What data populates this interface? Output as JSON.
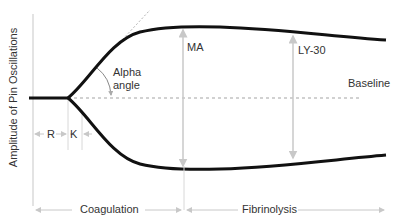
{
  "diagram": {
    "type": "thromboelastogram",
    "y_axis_label": "Amplitude of Pin Oscillations",
    "labels": {
      "alpha_line1": "Alpha",
      "alpha_line2": "angle",
      "ma": "MA",
      "ly30": "LY-30",
      "baseline": "Baseline",
      "r": "R",
      "k": "K",
      "coagulation": "Coagulation",
      "fibrinolysis": "Fibrinolysis"
    },
    "colors": {
      "curve": "#111111",
      "guide": "#c8c8c8",
      "dashed": "#999999",
      "text": "#333333"
    }
  }
}
